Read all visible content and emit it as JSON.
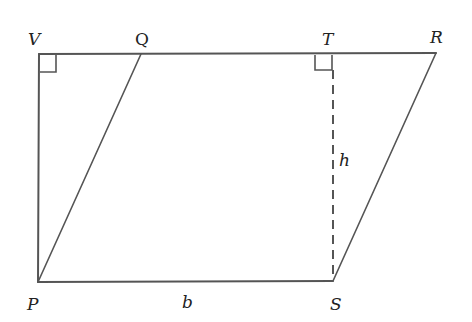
{
  "diagram": {
    "type": "geometry",
    "points": {
      "V": {
        "label": "V",
        "x": 39,
        "y": 54
      },
      "Q": {
        "label": "Q",
        "x": 141,
        "y": 54
      },
      "T": {
        "label": "T",
        "x": 332,
        "y": 54
      },
      "R": {
        "label": "R",
        "x": 436,
        "y": 53
      },
      "P": {
        "label": "P",
        "x": 38,
        "y": 282
      },
      "S": {
        "label": "S",
        "x": 333,
        "y": 281
      }
    },
    "labels": {
      "V": "V",
      "Q": "Q",
      "T": "T",
      "R": "R",
      "P": "P",
      "S": "S",
      "b": "b",
      "h": "h"
    },
    "segments": [
      {
        "from": "V",
        "to": "R",
        "style": "solid"
      },
      {
        "from": "V",
        "to": "P",
        "style": "solid"
      },
      {
        "from": "P",
        "to": "S",
        "style": "solid"
      },
      {
        "from": "P",
        "to": "Q",
        "style": "solid"
      },
      {
        "from": "S",
        "to": "R",
        "style": "solid"
      },
      {
        "from": "T",
        "to": "S",
        "style": "dashed"
      }
    ],
    "right_angles": [
      "V",
      "T"
    ],
    "colors": {
      "line": "#555555",
      "text": "#222222",
      "background": "#ffffff"
    }
  }
}
